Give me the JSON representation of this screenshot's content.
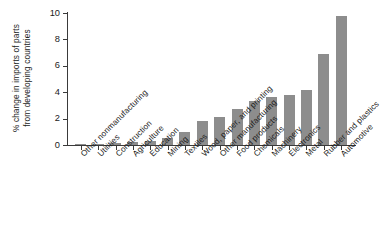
{
  "chart_data": {
    "type": "bar",
    "title": "",
    "subtitle": "",
    "xlabel": "",
    "ylabel": "% change in imports of parts from developing countries",
    "ylabel_line1": "% change in imports of parts",
    "ylabel_line2": "from developing countries",
    "ylim": [
      0,
      10
    ],
    "ytick_labels": [
      "0",
      "2",
      "4",
      "6",
      "8",
      "10"
    ],
    "yticks": [
      0,
      2,
      4,
      6,
      8,
      10
    ],
    "grid": false,
    "legend": null,
    "bar_color": "#8d8d8d",
    "axis_color": "#3a3a3a",
    "categories": [
      "Other nonmanufacturing",
      "Utilities",
      "Construction",
      "Agriculture",
      "Education",
      "Mining",
      "Textiles",
      "Wood, paper, and printing",
      "Other manufacturing",
      "Food products",
      "Chemicals",
      "Machinery",
      "Electronics",
      "Metal",
      "Rubber and plastics",
      "Automotive"
    ],
    "values": [
      0.05,
      0.1,
      0.15,
      0.2,
      0.3,
      0.5,
      1.0,
      1.8,
      2.1,
      2.7,
      3.3,
      3.6,
      3.8,
      4.2,
      6.9,
      9.8
    ]
  }
}
